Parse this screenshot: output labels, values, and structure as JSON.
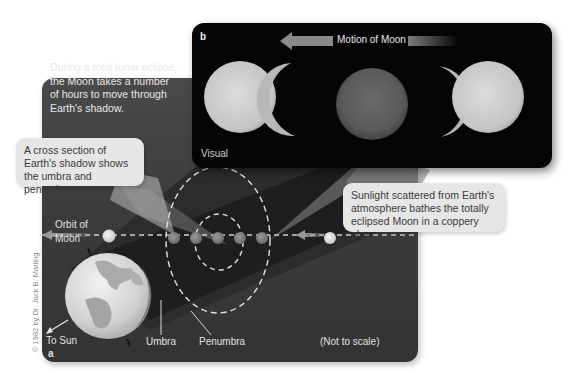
{
  "panel_a": {
    "letter": "a",
    "intro_text": [
      "During a total lunar eclipse,",
      "the Moon takes a number",
      "of hours to move through",
      "Earth's shadow."
    ],
    "orbit_label": [
      "Orbit of",
      "Moon"
    ],
    "to_sun_label": "To Sun",
    "umbra_label": "Umbra",
    "penumbra_label": "Penumbra",
    "scale_note": "(Not to scale)",
    "copyright": "© 1982 by Dr. Jack B. Marling"
  },
  "panel_b": {
    "letter": "b",
    "motion_label": "Motion of Moon",
    "mode_label": "Visual"
  },
  "callouts": {
    "cross_section": [
      "A cross section of",
      "Earth's shadow shows",
      "the umbra and penumbra."
    ],
    "sunlight": [
      "Sunlight scattered from Earth's",
      "atmosphere bathes the totally",
      "eclipsed Moon in a coppery glow."
    ]
  },
  "colors": {
    "panel_dark": "#3e3e3e",
    "photo_bg": "#050505",
    "callout_bg": "#e6e6e6",
    "moon_light": "#d6d6d6",
    "eclipsed_moon": "#8a8a8a"
  }
}
